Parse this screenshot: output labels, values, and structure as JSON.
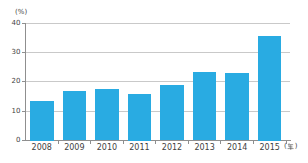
{
  "chart_data": {
    "type": "bar",
    "title": "",
    "xlabel": "",
    "ylabel": "",
    "y_unit": "(%)",
    "x_unit": "(年)",
    "categories": [
      "2008",
      "2009",
      "2010",
      "2011",
      "2012",
      "2013",
      "2014",
      "2015"
    ],
    "values": [
      13.5,
      16.7,
      17.7,
      16.0,
      18.8,
      23.2,
      23.1,
      35.5
    ],
    "ylim": [
      0,
      40
    ],
    "yticks": [
      0,
      10,
      20,
      30,
      40
    ],
    "grid": "horizontal",
    "legend": "none",
    "colors": {
      "bar": "#29ABE2",
      "gridline": "#c9c9c9",
      "axis": "#8f8f8f",
      "text": "#3f3f3f"
    }
  }
}
